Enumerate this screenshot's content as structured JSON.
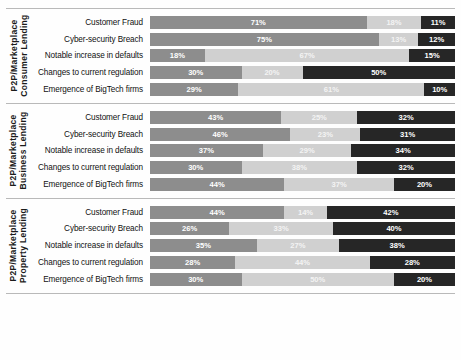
{
  "chart_data": {
    "type": "bar",
    "subtype": "stacked-horizontal-100pct",
    "title": "",
    "xlabel": "",
    "ylabel": "",
    "xlim": [
      0,
      100
    ],
    "grid": false,
    "legend_position": "none",
    "series": [
      {
        "name": "segment-1",
        "color": "#8d8d8d"
      },
      {
        "name": "segment-2",
        "color": "#d0d0d0"
      },
      {
        "name": "segment-3",
        "color": "#262626"
      }
    ],
    "categories": [
      "Customer Fraud",
      "Cyber-security Breach",
      "Notable increase in defaults",
      "Changes to current regulation",
      "Emergence of BigTech firms"
    ],
    "panels": [
      {
        "label": "P2P/Marketplace\nConsumer Lending",
        "label_line1": "P2P/Marketplace",
        "label_line2": "Consumer Lending",
        "rows": [
          {
            "category": "Customer Fraud",
            "values": [
              71,
              18,
              11
            ],
            "labels": [
              "71%",
              "18%",
              "11%"
            ]
          },
          {
            "category": "Cyber-security Breach",
            "values": [
              75,
              13,
              12
            ],
            "labels": [
              "75%",
              "13%",
              "12%"
            ]
          },
          {
            "category": "Notable increase in defaults",
            "values": [
              18,
              67,
              15
            ],
            "labels": [
              "18%",
              "67%",
              "15%"
            ]
          },
          {
            "category": "Changes to current regulation",
            "values": [
              30,
              20,
              50
            ],
            "labels": [
              "30%",
              "20%",
              "50%"
            ]
          },
          {
            "category": "Emergence of BigTech firms",
            "values": [
              29,
              61,
              10
            ],
            "labels": [
              "29%",
              "61%",
              "10%"
            ]
          }
        ]
      },
      {
        "label": "P2P/Marketplace\nBusiness Lending",
        "label_line1": "P2P/Marketplace",
        "label_line2": "Business Lending",
        "rows": [
          {
            "category": "Customer Fraud",
            "values": [
              43,
              25,
              32
            ],
            "labels": [
              "43%",
              "25%",
              "32%"
            ]
          },
          {
            "category": "Cyber-security Breach",
            "values": [
              46,
              23,
              31
            ],
            "labels": [
              "46%",
              "23%",
              "31%"
            ]
          },
          {
            "category": "Notable increase in defaults",
            "values": [
              37,
              29,
              34
            ],
            "labels": [
              "37%",
              "29%",
              "34%"
            ]
          },
          {
            "category": "Changes to current regulation",
            "values": [
              30,
              38,
              32
            ],
            "labels": [
              "30%",
              "38%",
              "32%"
            ]
          },
          {
            "category": "Emergence of BigTech firms",
            "values": [
              44,
              36,
              20
            ],
            "labels": [
              "44%",
              "37%",
              "20%"
            ]
          }
        ]
      },
      {
        "label": "P2P/Marketplace\nProperty Lending",
        "label_line1": "P2P/Marketplace",
        "label_line2": "Property Lending",
        "rows": [
          {
            "category": "Customer Fraud",
            "values": [
              44,
              14,
              42
            ],
            "labels": [
              "44%",
              "14%",
              "42%"
            ]
          },
          {
            "category": "Cyber-security Breach",
            "values": [
              26,
              34,
              40
            ],
            "labels": [
              "26%",
              "33%",
              "40%"
            ]
          },
          {
            "category": "Notable increase in defaults",
            "values": [
              35,
              27,
              38
            ],
            "labels": [
              "35%",
              "27%",
              "38%"
            ]
          },
          {
            "category": "Changes to current regulation",
            "values": [
              28,
              44,
              28
            ],
            "labels": [
              "28%",
              "44%",
              "28%"
            ]
          },
          {
            "category": "Emergence of BigTech firms",
            "values": [
              30,
              50,
              20
            ],
            "labels": [
              "30%",
              "50%",
              "20%"
            ]
          }
        ]
      }
    ]
  }
}
